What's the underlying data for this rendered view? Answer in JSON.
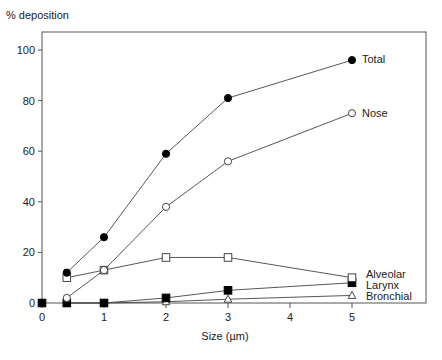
{
  "chart_data": {
    "type": "line",
    "title": "",
    "xlabel": "Size  (µm)",
    "ylabel": "% deposition",
    "xlim": [
      0,
      5.3
    ],
    "ylim": [
      0,
      107
    ],
    "xticks": [
      0,
      1,
      2,
      3,
      4,
      5
    ],
    "yticks": [
      0,
      20,
      40,
      60,
      80,
      100
    ],
    "grid": false,
    "legend_position": "inline-right",
    "x": [
      0.4,
      1,
      2,
      3,
      5
    ],
    "series": [
      {
        "name": "Total",
        "marker": "filled-circle",
        "values": [
          12,
          26,
          59,
          81,
          96
        ]
      },
      {
        "name": "Nose",
        "marker": "open-circle",
        "values": [
          2,
          13,
          38,
          56,
          75
        ]
      },
      {
        "name": "Alveolar",
        "marker": "open-square",
        "values": [
          10,
          13,
          18,
          18,
          10
        ]
      },
      {
        "name": "Larynx",
        "marker": "filled-square",
        "values": [
          0,
          0,
          2,
          5,
          8
        ]
      },
      {
        "name": "Bronchial",
        "marker": "open-triangle",
        "values": [
          0,
          0,
          0.5,
          1.5,
          3
        ]
      }
    ],
    "origin_point": {
      "x": 0,
      "y": 0,
      "marker": "filled-square"
    }
  }
}
